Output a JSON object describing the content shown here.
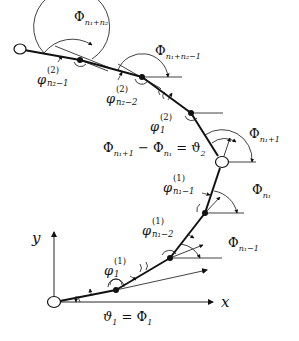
{
  "diagram": {
    "title": "",
    "nodes": [
      {
        "id": "end",
        "x": 20,
        "y": 49,
        "type": "open"
      },
      {
        "id": "n2",
        "x": 80,
        "y": 60,
        "type": "filled"
      },
      {
        "id": "n3",
        "x": 142,
        "y": 77,
        "type": "filled"
      },
      {
        "id": "n4",
        "x": 191,
        "y": 113,
        "type": "filled"
      },
      {
        "id": "joint",
        "x": 222,
        "y": 162,
        "type": "open"
      },
      {
        "id": "n6",
        "x": 205,
        "y": 213,
        "type": "filled"
      },
      {
        "id": "n7",
        "x": 170,
        "y": 258,
        "type": "filled"
      },
      {
        "id": "n8",
        "x": 116,
        "y": 290,
        "type": "filled"
      },
      {
        "id": "origin",
        "x": 54,
        "y": 302,
        "type": "open"
      }
    ],
    "axes": {
      "x_label": "x",
      "y_label": "y"
    },
    "labels": {
      "Phi_top": {
        "base": "Φ",
        "sub": "n₁+n₂"
      },
      "Phi_top2": {
        "base": "Φ",
        "sub": "n₁+n₂−1"
      },
      "phi_n2m1": {
        "base": "φ",
        "sup": "(2)",
        "sub": "n₂−1"
      },
      "phi_n2m2": {
        "base": "φ",
        "sup": "(2)",
        "sub": "n₂−2"
      },
      "phi_1_2": {
        "base": "φ",
        "sup": "(2)",
        "sub": "1"
      },
      "Phi_n1p1": {
        "base": "Φ",
        "sub": "n₁+1"
      },
      "equation": {
        "left": "Φ",
        "left_sub": "n₁+1",
        "minus": " − Φ",
        "mid_sub": "n₁",
        "eq": " = ϑ",
        "right_sub": "2"
      },
      "Phi_n1": {
        "base": "Φ",
        "sub": "n₁"
      },
      "phi_n1m1": {
        "base": "φ",
        "sup": "(1)",
        "sub": "n₁−1"
      },
      "phi_n1m2": {
        "base": "φ",
        "sup": "(1)",
        "sub": "n₁−2"
      },
      "Phi_n1m1": {
        "base": "Φ",
        "sub": "n₁−1"
      },
      "phi_1_1": {
        "base": "φ",
        "sup": "(1)",
        "sub": "1"
      },
      "bottom_eq": {
        "left": "ϑ",
        "left_sub": "1",
        "eq": " = Φ",
        "right_sub": "1"
      }
    },
    "colors": {
      "line": "#111111",
      "background": "#ffffff"
    }
  }
}
